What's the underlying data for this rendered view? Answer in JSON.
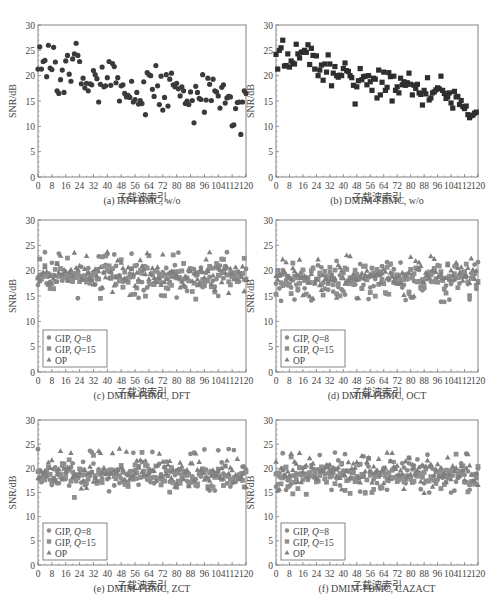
{
  "chart_data": [
    {
      "id": "a",
      "type": "scatter",
      "caption": "(a) IM-FBMC, w/o",
      "xlabel": "子载波索引",
      "ylabel": "SNR/dB",
      "xlim": [
        0,
        120
      ],
      "ylim": [
        0,
        30
      ],
      "xticks": [
        0,
        8,
        16,
        24,
        32,
        40,
        48,
        56,
        64,
        72,
        80,
        88,
        96,
        104,
        112,
        120
      ],
      "yticks": [
        0,
        5,
        10,
        15,
        20,
        25,
        30
      ],
      "grid": false,
      "legend": null,
      "series": [
        {
          "name": "IM-FBMC",
          "marker": "circle",
          "color": "#3a3a3a",
          "x": [
            0,
            1,
            2,
            3,
            4,
            5,
            6,
            7,
            8,
            9,
            10,
            11,
            12,
            13,
            14,
            15,
            16,
            17,
            18,
            19,
            20,
            21,
            22,
            23,
            24,
            25,
            26,
            27,
            28,
            29,
            30,
            31,
            32,
            33,
            34,
            35,
            36,
            37,
            38,
            39,
            40,
            41,
            42,
            43,
            44,
            45,
            46,
            47,
            48,
            49,
            50,
            51,
            52,
            53,
            54,
            55,
            56,
            57,
            58,
            59,
            60,
            61,
            62,
            63,
            64,
            65,
            66,
            67,
            68,
            69,
            70,
            71,
            72,
            73,
            74,
            75,
            76,
            77,
            78,
            79,
            80,
            81,
            82,
            83,
            84,
            85,
            86,
            87,
            88,
            89,
            90,
            91,
            92,
            93,
            94,
            95,
            96,
            97,
            98,
            99,
            100,
            101,
            102,
            103,
            104,
            105,
            106,
            107,
            108,
            109,
            110,
            111,
            112,
            113,
            114,
            115,
            116,
            117,
            118,
            119,
            120
          ],
          "y": [
            21.3,
            25.7,
            21.3,
            22.8,
            23.0,
            19.8,
            26.0,
            21.5,
            21.2,
            25.6,
            22.7,
            17.0,
            16.5,
            19.2,
            21.1,
            16.7,
            22.9,
            24.0,
            20.3,
            18.9,
            23.3,
            24.3,
            26.4,
            24.0,
            22.8,
            18.4,
            19.5,
            17.6,
            18.5,
            17.0,
            18.4,
            18.2,
            21.0,
            20.2,
            19.4,
            14.8,
            18.3,
            21.7,
            17.8,
            18.0,
            19.6,
            22.8,
            18.1,
            22.4,
            21.8,
            18.6,
            19.6,
            15.0,
            18.0,
            18.2,
            16.5,
            15.8,
            16.1,
            15.7,
            18.9,
            14.8,
            15.3,
            16.7,
            14.4,
            15.1,
            14.5,
            18.8,
            12.3,
            20.6,
            20.2,
            20.0,
            17.3,
            15.9,
            22.0,
            18.0,
            14.3,
            19.9,
            13.2,
            15.7,
            20.2,
            14.0,
            19.3,
            20.5,
            18.2,
            17.8,
            18.5,
            17.4,
            16.0,
            17.8,
            17.0,
            14.5,
            15.0,
            14.3,
            16.8,
            15.1,
            10.7,
            17.9,
            16.7,
            15.5,
            15.3,
            20.2,
            12.8,
            15.2,
            19.5,
            18.3,
            15.1,
            19.3,
            17.0,
            16.8,
            16.0,
            13.6,
            17.7,
            18.2,
            14.6,
            15.6,
            15.9,
            15.8,
            10.1,
            10.3,
            13.5,
            14.7,
            14.8,
            8.4,
            14.8,
            17.0,
            16.5
          ]
        }
      ]
    },
    {
      "id": "b",
      "type": "scatter",
      "caption": "(b) DMIM-FBMC, w/o",
      "xlabel": "子载波索引",
      "ylabel": "SNR/dB",
      "xlim": [
        0,
        120
      ],
      "ylim": [
        0,
        30
      ],
      "xticks": [
        0,
        8,
        16,
        24,
        32,
        40,
        48,
        56,
        64,
        72,
        80,
        88,
        96,
        104,
        112,
        120
      ],
      "yticks": [
        0,
        5,
        10,
        15,
        20,
        25,
        30
      ],
      "grid": false,
      "legend": null,
      "series": [
        {
          "name": "DMIM-FBMC",
          "marker": "square",
          "color": "#2e2e2e",
          "x": [
            0,
            1,
            2,
            3,
            4,
            5,
            6,
            7,
            8,
            9,
            10,
            11,
            12,
            13,
            14,
            15,
            16,
            17,
            18,
            19,
            20,
            21,
            22,
            23,
            24,
            25,
            26,
            27,
            28,
            29,
            30,
            31,
            32,
            33,
            34,
            35,
            36,
            37,
            38,
            39,
            40,
            41,
            42,
            43,
            44,
            45,
            46,
            47,
            48,
            49,
            50,
            51,
            52,
            53,
            54,
            55,
            56,
            57,
            58,
            59,
            60,
            61,
            62,
            63,
            64,
            65,
            66,
            67,
            68,
            69,
            70,
            71,
            72,
            73,
            74,
            75,
            76,
            77,
            78,
            79,
            80,
            81,
            82,
            83,
            84,
            85,
            86,
            87,
            88,
            89,
            90,
            91,
            92,
            93,
            94,
            95,
            96,
            97,
            98,
            99,
            100,
            101,
            102,
            103,
            104,
            105,
            106,
            107,
            108,
            109,
            110,
            111,
            112,
            113,
            114,
            115,
            116,
            117,
            118,
            119
          ],
          "y": [
            24.2,
            21.3,
            25.0,
            25.5,
            27.0,
            21.9,
            22.0,
            24.3,
            21.7,
            22.9,
            22.5,
            22.3,
            26.2,
            24.3,
            23.5,
            24.6,
            24.7,
            25.0,
            24.6,
            26.1,
            22.2,
            25.4,
            24.0,
            21.3,
            23.9,
            20.0,
            21.1,
            22.1,
            19.1,
            22.3,
            20.7,
            24.1,
            22.3,
            18.0,
            20.5,
            21.8,
            20.0,
            19.7,
            20.1,
            20.0,
            21.4,
            22.5,
            21.0,
            20.8,
            20.0,
            19.6,
            18.1,
            14.4,
            17.8,
            19.0,
            21.4,
            19.2,
            19.8,
            19.9,
            18.2,
            20.0,
            18.8,
            17.1,
            19.5,
            19.3,
            15.6,
            21.1,
            16.2,
            18.7,
            20.7,
            17.1,
            17.7,
            20.6,
            19.8,
            15.0,
            19.9,
            17.1,
            17.8,
            16.6,
            19.5,
            18.2,
            18.8,
            18.1,
            18.6,
            20.5,
            18.3,
            16.2,
            18.1,
            17.5,
            18.3,
            16.6,
            16.3,
            14.2,
            17.1,
            16.4,
            19.6,
            15.2,
            15.6,
            16.6,
            16.8,
            17.2,
            17.6,
            17.4,
            19.9,
            17.1,
            16.5,
            15.5,
            15.8,
            16.6,
            14.6,
            13.6,
            16.9,
            15.8,
            15.9,
            14.3,
            15.1,
            13.9,
            13.5,
            14.0,
            12.3,
            11.7,
            12.1,
            12.2,
            12.6,
            12.8
          ]
        }
      ]
    },
    {
      "id": "c",
      "type": "scatter",
      "caption": "(c) DMIM-FBMC, DFT",
      "xlabel": "子载波索引",
      "ylabel": "SNR/dB",
      "xlim": [
        0,
        120
      ],
      "ylim": [
        0,
        30
      ],
      "xticks": [
        0,
        8,
        16,
        24,
        32,
        40,
        48,
        56,
        64,
        72,
        80,
        88,
        96,
        104,
        112,
        120
      ],
      "yticks": [
        0,
        5,
        10,
        15,
        20,
        25,
        30
      ],
      "grid": false,
      "legend": {
        "position": "lower left",
        "entries": [
          {
            "marker": "circle",
            "label_prefix": "GIP, ",
            "label_var": "Q",
            "label_suffix": "=8"
          },
          {
            "marker": "square",
            "label_prefix": "GIP, ",
            "label_var": "Q",
            "label_suffix": "=15"
          },
          {
            "marker": "triangle",
            "label_prefix": "OP",
            "label_var": "",
            "label_suffix": ""
          }
        ]
      },
      "series_summary": {
        "GIP, Q=8": {
          "range": [
            14.5,
            24
          ],
          "mean": 18.8
        },
        "GIP, Q=15": {
          "range": [
            14.3,
            23.3
          ],
          "mean": 18.7
        },
        "OP": {
          "range": [
            15,
            24
          ],
          "mean": 19.2
        }
      },
      "seed": 11
    },
    {
      "id": "d",
      "type": "scatter",
      "caption": "(d) DMIM-FBMC, OCT",
      "xlabel": "子载波索引",
      "ylabel": "SNR/dB",
      "xlim": [
        0,
        120
      ],
      "ylim": [
        0,
        30
      ],
      "xticks": [
        0,
        8,
        16,
        24,
        32,
        40,
        48,
        56,
        64,
        72,
        80,
        88,
        96,
        104,
        112,
        120
      ],
      "yticks": [
        0,
        5,
        10,
        15,
        20,
        25,
        30
      ],
      "grid": false,
      "legend": {
        "position": "lower left",
        "entries": [
          {
            "marker": "circle",
            "label_prefix": "GIP, ",
            "label_var": "Q",
            "label_suffix": "=8"
          },
          {
            "marker": "square",
            "label_prefix": "GIP, ",
            "label_var": "Q",
            "label_suffix": "=15"
          },
          {
            "marker": "triangle",
            "label_prefix": "OP",
            "label_var": "",
            "label_suffix": ""
          }
        ]
      },
      "series_summary": {
        "GIP, Q=8": {
          "range": [
            13.6,
            22.2
          ],
          "mean": 18.3
        },
        "GIP, Q=15": {
          "range": [
            14.8,
            21.5
          ],
          "mean": 18.4
        },
        "OP": {
          "range": [
            14.5,
            23.2
          ],
          "mean": 18.9
        }
      },
      "seed": 23
    },
    {
      "id": "e",
      "type": "scatter",
      "caption": "(e) DMIM-FBMC, ZCT",
      "xlabel": "子载波索引",
      "ylabel": "SNR/dB",
      "xlim": [
        0,
        120
      ],
      "ylim": [
        0,
        30
      ],
      "xticks": [
        0,
        8,
        16,
        24,
        32,
        40,
        48,
        56,
        64,
        72,
        80,
        88,
        96,
        104,
        112,
        120
      ],
      "yticks": [
        0,
        5,
        10,
        15,
        20,
        25,
        30
      ],
      "grid": false,
      "legend": {
        "position": "lower left",
        "entries": [
          {
            "marker": "circle",
            "label_prefix": "GIP, ",
            "label_var": "Q",
            "label_suffix": "=8"
          },
          {
            "marker": "square",
            "label_prefix": "GIP, ",
            "label_var": "Q",
            "label_suffix": "=15"
          },
          {
            "marker": "triangle",
            "label_prefix": "OP",
            "label_var": "",
            "label_suffix": ""
          }
        ]
      },
      "series_summary": {
        "GIP, Q=8": {
          "range": [
            15,
            24
          ],
          "mean": 18.6
        },
        "GIP, Q=15": {
          "range": [
            13.8,
            23.4
          ],
          "mean": 18.4
        },
        "OP": {
          "range": [
            15.5,
            24.2
          ],
          "mean": 19.3
        }
      },
      "seed": 37
    },
    {
      "id": "f",
      "type": "scatter",
      "caption": "(f) DMIM-FBMC, CAZACT",
      "xlabel": "子载波索引",
      "ylabel": "SNR/dB",
      "xlim": [
        0,
        120
      ],
      "ylim": [
        0,
        30
      ],
      "xticks": [
        0,
        8,
        16,
        24,
        32,
        40,
        48,
        56,
        64,
        72,
        80,
        88,
        96,
        104,
        112,
        120
      ],
      "yticks": [
        0,
        5,
        10,
        15,
        20,
        25,
        30
      ],
      "grid": false,
      "legend": {
        "position": "lower left",
        "entries": [
          {
            "marker": "circle",
            "label_prefix": "GIP, ",
            "label_var": "Q",
            "label_suffix": "=8"
          },
          {
            "marker": "square",
            "label_prefix": "GIP, ",
            "label_var": "Q",
            "label_suffix": "=15"
          },
          {
            "marker": "triangle",
            "label_prefix": "OP",
            "label_var": "",
            "label_suffix": ""
          }
        ]
      },
      "series_summary": {
        "GIP, Q=8": {
          "range": [
            14.8,
            23.4
          ],
          "mean": 18.9
        },
        "GIP, Q=15": {
          "range": [
            14,
            23
          ],
          "mean": 18.4
        },
        "OP": {
          "range": [
            14.8,
            23.3
          ],
          "mean": 19.2
        }
      },
      "seed": 53
    }
  ],
  "figure": {
    "marker_colors": {
      "circle": "#8a8a8a",
      "square": "#8f8f8f",
      "triangle": "#7f7f7f"
    },
    "single_colors": {
      "circle": "#3a3a3a",
      "square": "#2e2e2e"
    },
    "axis_color": "#777777"
  }
}
